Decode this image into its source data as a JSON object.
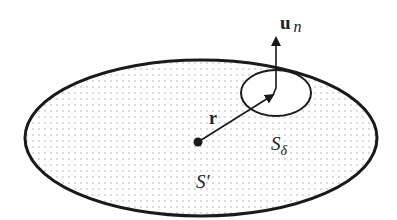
{
  "diagram": {
    "labels": {
      "normal_vector": "u",
      "normal_sub": "n",
      "position_vector": "r",
      "small_region": "S",
      "small_region_sub": "δ",
      "large_region": "S′"
    },
    "colors": {
      "stroke": "#1a1a1a",
      "dot_pattern": "#9a9a9a",
      "background": "#ffffff"
    }
  }
}
